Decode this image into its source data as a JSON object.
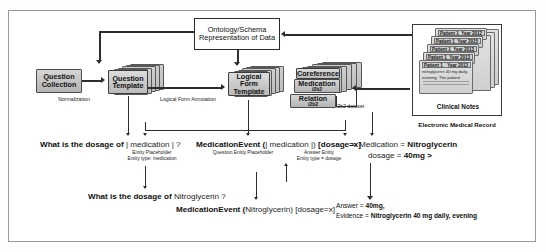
{
  "diagram": {
    "boxes": {
      "ontology": "Ontology/Schema Representation of Data",
      "question_collection": "Question Collection",
      "question_template": "Question Template",
      "logical_form_template": "Logical Form Template",
      "coreference": "Coreference",
      "medication": "Medication",
      "medication_sub": "i2b2",
      "relation": "Relation",
      "relation_sub": "i2b2"
    },
    "edge_labels": {
      "normalization": "Normalization",
      "logical_form_annotation": "Logical Form Annotation",
      "i2b2_dataset": "i2b2 dataset"
    },
    "notes_panel": {
      "caption": "Clinical Notes",
      "records": [
        {
          "patient": "Patient 1",
          "year": "Year 2012"
        },
        {
          "patient": "Patient 1",
          "year": "Year 2015"
        },
        {
          "patient": "Patient 1",
          "year": "Year 2013"
        },
        {
          "patient": "Patient 1",
          "year": "Year 2013"
        },
        {
          "patient": "Patient 1",
          "year": "Year 2013"
        }
      ],
      "note_text": "nitroglycerin 40 mg daily, evening. The patient"
    },
    "emr_caption": "Electronic Medical Record",
    "template_row": {
      "question_template_text": "What is the dosage of | medication | ?",
      "question_template_bold": "What is the dosage of",
      "question_template_slot": "| medication | ?",
      "question_template_ann": "Entity Placeholder\nEntity type: medication",
      "logical_form_bold": "MedicationEvent (",
      "logical_form_slot": "| medication |",
      "logical_form_close": ") ",
      "logical_form_dosage": "[dosage=x]",
      "logical_form_ann_left": "Question Entity Placeholder",
      "logical_form_ann_right": "Answer Entity\nEntity type = dosage",
      "relation_text_open": "< Medication = ",
      "relation_medication": "Nitroglycerin",
      "relation_dosage_label": "dosage = ",
      "relation_dosage_value": "40mg >"
    },
    "instance_row": {
      "question_bold": "What is the dosage of",
      "question_entity": "Nitroglycerin ?",
      "logical_form_bold": "MedicationEvent (",
      "logical_form_entity": "Nitroglycerin",
      "logical_form_close": ")",
      "logical_form_dosage": "[dosage=x]",
      "answer_label": "Answer = ",
      "answer_value": "40mg,",
      "evidence_label": "Evidence = ",
      "evidence_value": "Nitroglycerin 40 mg daily, evening"
    }
  }
}
